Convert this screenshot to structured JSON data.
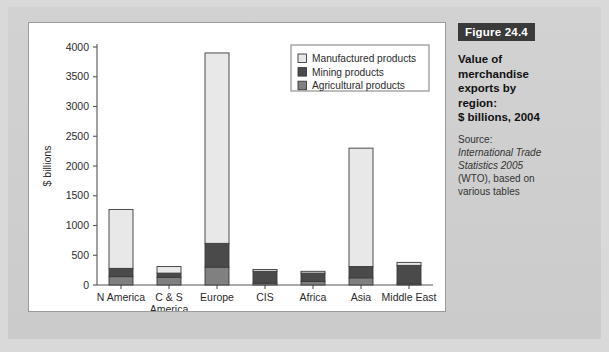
{
  "figure": {
    "badge": "Figure 24.4",
    "title_lines": [
      "Value of",
      "merchandise",
      "exports by",
      "region:",
      "$ billions, 2004"
    ],
    "source_label": "Source:",
    "source_italic_lines": [
      "International Trade",
      "Statistics 2005"
    ],
    "source_rest_lines": [
      "(WTO), based on",
      "various tables"
    ]
  },
  "colors": {
    "manufactured": "#e8e8e8",
    "mining": "#4a4a4a",
    "agricultural": "#808080",
    "outline": "#3a3a3a",
    "axis": "#555555",
    "frame": "#cfcfcf",
    "badge_bg": "#3a3a3a",
    "card_bg": "#ffffff"
  },
  "chart_data": {
    "type": "bar",
    "subtype": "stacked-vertical",
    "title": "",
    "xlabel": "",
    "ylabel": "$ billions",
    "ylim": [
      0,
      4000
    ],
    "yticks": [
      0,
      500,
      1000,
      1500,
      2000,
      2500,
      3000,
      3500,
      4000
    ],
    "ytick_labels": [
      "0",
      "500",
      "1000",
      "1500",
      "2000",
      "2500",
      "3000",
      "3500",
      "4000"
    ],
    "grid": false,
    "legend_position": "top-right",
    "categories": [
      "N America",
      "C & S America",
      "Europe",
      "CIS",
      "Africa",
      "Asia",
      "Middle East"
    ],
    "category_label_lines": [
      [
        "N America"
      ],
      [
        "C & S",
        "America"
      ],
      [
        "Europe"
      ],
      [
        "CIS"
      ],
      [
        "Africa"
      ],
      [
        "Asia"
      ],
      [
        "Middle East"
      ]
    ],
    "series": [
      {
        "name": "Agricultural products",
        "color": "#808080",
        "values": [
          140,
          130,
          300,
          30,
          60,
          120,
          20
        ]
      },
      {
        "name": "Mining products",
        "color": "#4a4a4a",
        "values": [
          140,
          70,
          400,
          200,
          140,
          190,
          310
        ]
      },
      {
        "name": "Manufactured products",
        "color": "#e8e8e8",
        "values": [
          990,
          110,
          3200,
          30,
          30,
          1990,
          50
        ]
      }
    ],
    "totals": [
      1270,
      310,
      3900,
      260,
      230,
      2300,
      380
    ],
    "stack_order_bottom_to_top": [
      "Agricultural products",
      "Mining products",
      "Manufactured products"
    ],
    "legend_entries": [
      {
        "label": "Manufactured products",
        "color": "#e8e8e8"
      },
      {
        "label": "Mining products",
        "color": "#4a4a4a"
      },
      {
        "label": "Agricultural products",
        "color": "#808080"
      }
    ]
  }
}
